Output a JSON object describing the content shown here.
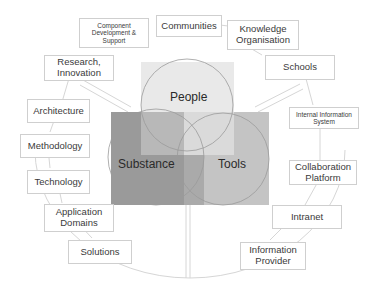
{
  "venn": {
    "people": "People",
    "substance": "Substance",
    "tools": "Tools"
  },
  "boxes": {
    "component_dev": "Component Development & Support",
    "communities": "Communities",
    "knowledge_org": "Knowledge Organisation",
    "research": "Research, Innovation",
    "schools": "Schools",
    "architecture": "Architecture",
    "internal_info": "Internal Information System",
    "methodology": "Methodology",
    "collaboration": "Collaboration Platform",
    "technology": "Technology",
    "intranet": "Intranet",
    "app_domains": "Application Domains",
    "solutions": "Solutions",
    "info_provider": "Information Provider"
  },
  "colors": {
    "people_square": "#e9e9e9",
    "substance_square": "#9a9a9a",
    "tools_square": "#c4c4c4",
    "outline": "#bdbdbd"
  }
}
